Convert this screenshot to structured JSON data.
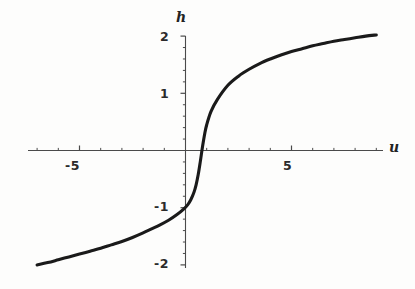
{
  "figure": {
    "background_color": "#fdfdfc",
    "curve_color": "#1a1a1a",
    "axis_color": "#4a4a4a",
    "width": 415,
    "height": 289
  },
  "axis_labels": {
    "x": "u",
    "y": "h"
  },
  "chart_data": {
    "type": "line",
    "title": "",
    "xlabel": "u",
    "ylabel": "h",
    "xlim": [
      -7.0,
      9.0
    ],
    "ylim": [
      -2.15,
      2.15
    ],
    "grid": false,
    "legend": null,
    "x_ticks_major": [
      -5,
      5
    ],
    "x_tick_labels": [
      "-5",
      "5"
    ],
    "y_ticks_major": [
      2,
      1,
      -1,
      -2
    ],
    "y_tick_labels": [
      "2",
      "1",
      "-1",
      "-2"
    ],
    "x_minor_tick_step": 1,
    "y_minor_tick_step": 0.2,
    "series": [
      {
        "name": "h(u)",
        "x": [
          -7.0,
          -6.5,
          -6.0,
          -5.5,
          -5.0,
          -4.5,
          -4.0,
          -3.5,
          -3.0,
          -2.5,
          -2.0,
          -1.6,
          -1.2,
          -0.8,
          -0.4,
          -0.1,
          0.1,
          0.25,
          0.4,
          0.5,
          0.6,
          0.7,
          0.8,
          0.9,
          1.0,
          1.2,
          1.5,
          2.0,
          2.5,
          3.0,
          3.5,
          4.0,
          4.5,
          5.0,
          5.5,
          6.0,
          6.5,
          7.0,
          7.5,
          8.0,
          8.5,
          9.0
        ],
        "y": [
          -2.0,
          -1.96,
          -1.91,
          -1.86,
          -1.81,
          -1.76,
          -1.71,
          -1.65,
          -1.59,
          -1.52,
          -1.44,
          -1.37,
          -1.3,
          -1.22,
          -1.12,
          -1.03,
          -0.95,
          -0.86,
          -0.73,
          -0.6,
          -0.42,
          -0.19,
          0.06,
          0.28,
          0.45,
          0.68,
          0.89,
          1.14,
          1.3,
          1.42,
          1.52,
          1.6,
          1.67,
          1.73,
          1.78,
          1.83,
          1.87,
          1.91,
          1.94,
          1.97,
          2.0,
          2.02
        ]
      }
    ]
  }
}
